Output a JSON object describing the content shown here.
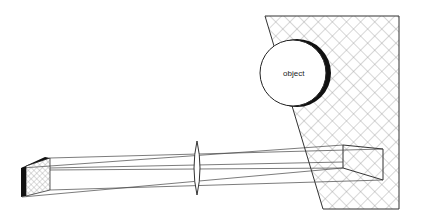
{
  "diagram": {
    "title": "",
    "object_label": "object",
    "colors": {
      "line": "#333333",
      "hatch": "#999999",
      "dark": "#111111",
      "background": "#ffffff"
    },
    "elements": [
      {
        "id": "background-plane",
        "type": "hatched-polygon"
      },
      {
        "id": "object-sphere",
        "type": "circle",
        "label": "object"
      },
      {
        "id": "lens",
        "type": "biconvex-lens"
      },
      {
        "id": "image-plane",
        "type": "hatched-parallelogram"
      },
      {
        "id": "projected-region",
        "type": "wireframe-box"
      },
      {
        "id": "rays",
        "type": "lines",
        "count": 4
      }
    ]
  }
}
